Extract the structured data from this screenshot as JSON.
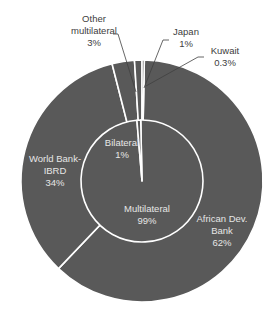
{
  "chart_data": {
    "type": "pie",
    "subtype": "nested-donut",
    "title": "",
    "colors": {
      "slice_fill": "#595959",
      "separator": "#ffffff",
      "label_inside": "#e6e6e6",
      "label_outside": "#404040",
      "leader_line": "#404040"
    },
    "geometry": {
      "cx": 142,
      "cy": 181,
      "outer_r": 121,
      "inner_r": 61
    },
    "inner_ring": {
      "start_deg": -1.2,
      "slices": [
        {
          "label": "Multilateral",
          "value": 99,
          "display": "99%"
        },
        {
          "label": "Bilateral",
          "value": 1,
          "display": "1%"
        }
      ]
    },
    "outer_ring": {
      "start_deg": 1.1,
      "slices": [
        {
          "label": "African Dev. Bank",
          "value": 62,
          "display": "62%"
        },
        {
          "label": "World Bank-IBRD",
          "value": 34,
          "display": "34%"
        },
        {
          "label": "Other multilateral",
          "value": 3,
          "display": "3%"
        },
        {
          "label": "Japan",
          "value": 1,
          "display": "1%"
        },
        {
          "label": "Kuwait",
          "value": 0.3,
          "display": "0.3%"
        }
      ]
    }
  },
  "labels": {
    "other_multilateral": {
      "line1": "Other",
      "line2": "multilateral",
      "pct": "3%"
    },
    "japan": {
      "line1": "Japan",
      "pct": "1%"
    },
    "kuwait": {
      "line1": "Kuwait",
      "pct": "0.3%"
    },
    "world_bank_ibrd": {
      "line1": "World Bank-",
      "line2": "IBRD",
      "pct": "34%"
    },
    "bilateral": {
      "line1": "Bilateral",
      "pct": "1%"
    },
    "multilateral": {
      "line1": "Multilateral",
      "pct": "99%"
    },
    "african_dev_bank": {
      "line1": "African Dev.",
      "line2": "Bank",
      "pct": "62%"
    }
  }
}
